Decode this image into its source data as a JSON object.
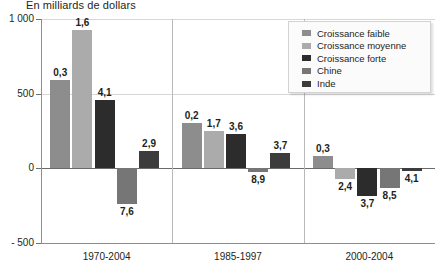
{
  "chart_data": {
    "type": "bar",
    "title": "En milliards de dollars",
    "xlabel": "",
    "ylabel": "",
    "ylim": [
      -500,
      1000
    ],
    "yticks": [
      1000,
      500,
      0,
      -500
    ],
    "ytick_labels": [
      "1 000",
      "500",
      "0",
      "- 500"
    ],
    "grid": true,
    "legend_position": "top-right",
    "categories": [
      "1970-2004",
      "1985-1997",
      "2000-2004"
    ],
    "series": [
      {
        "name": "Croissance faible",
        "color": "#8d8d8d",
        "values": [
          590,
          305,
          85
        ],
        "labels": [
          "0,3",
          "0,2",
          "0,3"
        ]
      },
      {
        "name": "Croissance moyenne",
        "color": "#ababab",
        "values": [
          925,
          250,
          -70
        ],
        "labels": [
          "1,6",
          "1,7",
          "2,4"
        ]
      },
      {
        "name": "Croissance forte",
        "color": "#2c2c2c",
        "values": [
          460,
          230,
          -185
        ],
        "labels": [
          "4,1",
          "3,6",
          "3,7"
        ]
      },
      {
        "name": "Chine",
        "color": "#767676",
        "values": [
          -240,
          -25,
          -130
        ],
        "labels": [
          "7,6",
          "8,9",
          "8,5"
        ]
      },
      {
        "name": "Inde",
        "color": "#3c3c3c",
        "values": [
          115,
          105,
          -15
        ],
        "labels": [
          "2,9",
          "3,7",
          "4,1"
        ]
      }
    ]
  },
  "legend": {
    "items": [
      {
        "label": "Croissance faible",
        "color": "#8d8d8d"
      },
      {
        "label": "Croissance moyenne",
        "color": "#ababab"
      },
      {
        "label": "Croissance forte",
        "color": "#2c2c2c"
      },
      {
        "label": "Chine",
        "color": "#767676"
      },
      {
        "label": "Inde",
        "color": "#3c3c3c"
      }
    ]
  }
}
